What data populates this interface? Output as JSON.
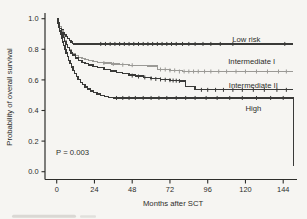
{
  "figure": {
    "kind": "kaplan-meier-survival-plot",
    "p_value_label": "P = 0.003"
  },
  "chart_data": {
    "type": "line",
    "subtype": "kaplan-meier-step",
    "title": "",
    "xlabel": "Months after SCT",
    "ylabel": "Probability of overall survival",
    "xlim": [
      -7.5,
      152.5
    ],
    "ylim": [
      0.0,
      1.0
    ],
    "grid": false,
    "legend": "inline-curve-labels",
    "x_ticks": [
      {
        "label": "0",
        "m": 0
      },
      {
        "label": "24",
        "m": 24
      },
      {
        "label": "48",
        "m": 48
      },
      {
        "label": "72",
        "m": 72
      },
      {
        "label": "96",
        "m": 96
      },
      {
        "label": "120",
        "m": 120
      },
      {
        "label": "144",
        "m": 144
      }
    ],
    "y_ticks": [
      {
        "label": "1.0",
        "v": 1.0
      },
      {
        "label": "0.8",
        "v": 0.8
      },
      {
        "label": "0.6",
        "v": 0.6
      },
      {
        "label": "0.4",
        "v": 0.4
      },
      {
        "label": "0.2",
        "v": 0.2
      },
      {
        "label": "0.0",
        "v": 0.0
      }
    ],
    "annotation": {
      "text": "P = 0.003",
      "m": -0.4,
      "v": 0.128
    },
    "series": [
      {
        "name": "Low risk",
        "color": "#3a3a38",
        "label": {
          "text": "Low risk",
          "m": 120.5,
          "v": 0.862
        },
        "points": [
          [
            0,
            1.0
          ],
          [
            1,
            0.972
          ],
          [
            2,
            0.948
          ],
          [
            3,
            0.928
          ],
          [
            4,
            0.91
          ],
          [
            5,
            0.896
          ],
          [
            6,
            0.882
          ],
          [
            7,
            0.87
          ],
          [
            8,
            0.858
          ],
          [
            9,
            0.848
          ],
          [
            10,
            0.84
          ],
          [
            11,
            0.835
          ],
          [
            150,
            0.835
          ]
        ],
        "censors": [
          [
            28,
            0.835
          ],
          [
            31,
            0.835
          ],
          [
            34,
            0.835
          ],
          [
            37,
            0.835
          ],
          [
            40,
            0.835
          ],
          [
            43,
            0.835
          ],
          [
            46,
            0.835
          ],
          [
            49,
            0.835
          ],
          [
            52,
            0.835
          ],
          [
            55,
            0.835
          ],
          [
            58,
            0.835
          ],
          [
            61,
            0.835
          ],
          [
            64,
            0.835
          ],
          [
            67,
            0.835
          ],
          [
            70,
            0.835
          ],
          [
            73,
            0.835
          ],
          [
            76,
            0.835
          ],
          [
            80,
            0.835
          ],
          [
            84,
            0.835
          ],
          [
            88,
            0.835
          ],
          [
            93,
            0.835
          ],
          [
            98,
            0.835
          ],
          [
            104,
            0.835
          ],
          [
            112,
            0.835
          ],
          [
            145,
            0.835
          ]
        ]
      },
      {
        "name": "Intermediate I",
        "color": "#9b9a96",
        "label": {
          "text": "Intermediate I",
          "m": 124,
          "v": 0.723
        },
        "points": [
          [
            0,
            1.0
          ],
          [
            1,
            0.976
          ],
          [
            2,
            0.95
          ],
          [
            3,
            0.92
          ],
          [
            4,
            0.888
          ],
          [
            5,
            0.858
          ],
          [
            6,
            0.833
          ],
          [
            7,
            0.812
          ],
          [
            8,
            0.795
          ],
          [
            9,
            0.78
          ],
          [
            10,
            0.77
          ],
          [
            12,
            0.758
          ],
          [
            14,
            0.748
          ],
          [
            16,
            0.74
          ],
          [
            18,
            0.734
          ],
          [
            20,
            0.728
          ],
          [
            23,
            0.722
          ],
          [
            26,
            0.716
          ],
          [
            30,
            0.71
          ],
          [
            35,
            0.704
          ],
          [
            40,
            0.699
          ],
          [
            46,
            0.696
          ],
          [
            52,
            0.693
          ],
          [
            58,
            0.69
          ],
          [
            64,
            0.668
          ],
          [
            72,
            0.662
          ],
          [
            80,
            0.655
          ],
          [
            150,
            0.655
          ]
        ],
        "censors": [
          [
            30,
            0.71
          ],
          [
            36,
            0.704
          ],
          [
            42,
            0.699
          ],
          [
            48,
            0.696
          ],
          [
            66,
            0.668
          ],
          [
            69,
            0.668
          ],
          [
            72,
            0.662
          ],
          [
            75,
            0.662
          ],
          [
            78,
            0.655
          ],
          [
            81,
            0.655
          ],
          [
            84,
            0.655
          ],
          [
            87,
            0.655
          ],
          [
            90,
            0.655
          ],
          [
            94,
            0.655
          ],
          [
            98,
            0.655
          ],
          [
            103,
            0.655
          ],
          [
            108,
            0.655
          ],
          [
            114,
            0.655
          ],
          [
            120,
            0.655
          ],
          [
            127,
            0.655
          ],
          [
            134,
            0.655
          ],
          [
            141,
            0.655
          ],
          [
            146,
            0.655
          ]
        ]
      },
      {
        "name": "Intermediate II",
        "color": "#3a3a38",
        "label": {
          "text": "Intermediate II",
          "m": 125,
          "v": 0.567
        },
        "points": [
          [
            0,
            1.0
          ],
          [
            1,
            0.966
          ],
          [
            2,
            0.936
          ],
          [
            3,
            0.906
          ],
          [
            4,
            0.878
          ],
          [
            5,
            0.852
          ],
          [
            6,
            0.83
          ],
          [
            7,
            0.81
          ],
          [
            8,
            0.792
          ],
          [
            9,
            0.776
          ],
          [
            10,
            0.762
          ],
          [
            12,
            0.744
          ],
          [
            14,
            0.729
          ],
          [
            16,
            0.716
          ],
          [
            18,
            0.706
          ],
          [
            20,
            0.698
          ],
          [
            23,
            0.688
          ],
          [
            26,
            0.679
          ],
          [
            30,
            0.668
          ],
          [
            34,
            0.658
          ],
          [
            38,
            0.649
          ],
          [
            42,
            0.64
          ],
          [
            46,
            0.632
          ],
          [
            50,
            0.625
          ],
          [
            55,
            0.617
          ],
          [
            60,
            0.61
          ],
          [
            66,
            0.603
          ],
          [
            72,
            0.598
          ],
          [
            78,
            0.593
          ],
          [
            82,
            0.558
          ],
          [
            88,
            0.535
          ],
          [
            150,
            0.535
          ]
        ],
        "censors": [
          [
            48,
            0.628
          ],
          [
            52,
            0.622
          ],
          [
            56,
            0.616
          ],
          [
            60,
            0.61
          ],
          [
            63,
            0.606
          ],
          [
            66,
            0.603
          ],
          [
            69,
            0.601
          ],
          [
            72,
            0.598
          ],
          [
            74,
            0.596
          ],
          [
            76,
            0.595
          ],
          [
            78,
            0.593
          ],
          [
            92,
            0.535
          ],
          [
            96,
            0.535
          ],
          [
            101,
            0.535
          ],
          [
            106,
            0.535
          ],
          [
            112,
            0.535
          ],
          [
            118,
            0.535
          ],
          [
            125,
            0.535
          ],
          [
            132,
            0.535
          ],
          [
            140,
            0.535
          ],
          [
            146,
            0.535
          ]
        ]
      },
      {
        "name": "High",
        "color": "#3a3a38",
        "label": {
          "text": "High",
          "m": 125,
          "v": 0.412
        },
        "points": [
          [
            0,
            1.0
          ],
          [
            0.7,
            0.972
          ],
          [
            1.4,
            0.946
          ],
          [
            2,
            0.92
          ],
          [
            2.6,
            0.896
          ],
          [
            3.2,
            0.872
          ],
          [
            3.8,
            0.848
          ],
          [
            4.5,
            0.824
          ],
          [
            5.2,
            0.8
          ],
          [
            6,
            0.776
          ],
          [
            6.8,
            0.752
          ],
          [
            7.6,
            0.728
          ],
          [
            8.4,
            0.706
          ],
          [
            9.3,
            0.684
          ],
          [
            10.3,
            0.662
          ],
          [
            11.3,
            0.642
          ],
          [
            12.4,
            0.622
          ],
          [
            13.6,
            0.604
          ],
          [
            15,
            0.585
          ],
          [
            16.5,
            0.568
          ],
          [
            18,
            0.553
          ],
          [
            19.7,
            0.54
          ],
          [
            21.5,
            0.528
          ],
          [
            23.5,
            0.517
          ],
          [
            25.7,
            0.507
          ],
          [
            28,
            0.499
          ],
          [
            30.5,
            0.492
          ],
          [
            33,
            0.486
          ],
          [
            36,
            0.482
          ],
          [
            150.4,
            0.482
          ],
          [
            150.4,
            0.04
          ]
        ],
        "censors": [
          [
            38,
            0.482
          ],
          [
            42,
            0.482
          ],
          [
            46,
            0.482
          ],
          [
            50,
            0.482
          ],
          [
            55,
            0.482
          ],
          [
            60,
            0.482
          ],
          [
            65,
            0.482
          ],
          [
            70,
            0.482
          ],
          [
            76,
            0.482
          ],
          [
            82,
            0.482
          ],
          [
            88,
            0.482
          ],
          [
            95,
            0.482
          ],
          [
            102,
            0.482
          ],
          [
            110,
            0.482
          ],
          [
            118,
            0.482
          ],
          [
            127,
            0.482
          ],
          [
            136,
            0.482
          ],
          [
            144,
            0.482
          ]
        ]
      }
    ]
  }
}
